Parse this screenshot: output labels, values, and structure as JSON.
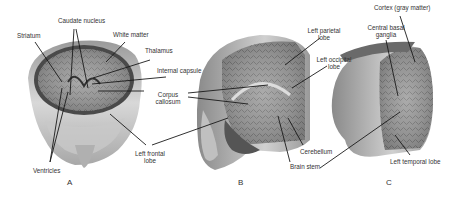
{
  "figure": {
    "panels": [
      {
        "id": "A",
        "label": "A"
      },
      {
        "id": "B",
        "label": "B"
      },
      {
        "id": "C",
        "label": "C"
      }
    ],
    "labels": {
      "caudate_nucleus": "Caudate nucleus",
      "striatum": "Striatum",
      "white_matter": "White matter",
      "thalamus": "Thalamus",
      "internal_capsule": "Internal capsule",
      "corpus_callosum_1": "Corpus",
      "corpus_callosum_2": "callosum",
      "ventricles": "Ventricles",
      "left_frontal_lobe_1": "Left frontal",
      "left_frontal_lobe_2": "lobe",
      "left_parietal_lobe_1": "Left parietal",
      "left_parietal_lobe_2": "lobe",
      "left_occipital_lobe_1": "Left occipital",
      "left_occipital_lobe_2": "lobe",
      "cerebellum": "Cerebellum",
      "brain_stem": "Brain stem",
      "cortex": "Cortex (gray matter)",
      "central_basal_ganglia_1": "Central basal",
      "central_basal_ganglia_2": "ganglia",
      "left_temporal_lobe": "Left temporal lobe"
    }
  }
}
